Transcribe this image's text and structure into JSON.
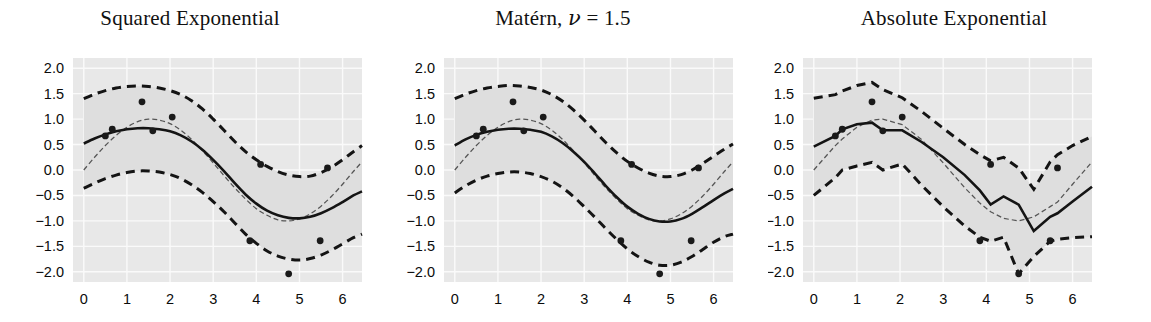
{
  "figure": {
    "background": "#ffffff",
    "panel_background": "#e8e8e8",
    "grid_color": "#fafafa",
    "line_color": "#141414",
    "point_color": "#1a1a1a",
    "truth_color": "#555555",
    "width": 1151,
    "height": 322
  },
  "axis": {
    "ytick_labels": [
      "2.0",
      "1.5",
      "1.0",
      "0.5",
      "0.0",
      "−0.5",
      "−1.0",
      "−1.5",
      "−2.0"
    ],
    "ytick_values": [
      2.0,
      1.5,
      1.0,
      0.5,
      0.0,
      -0.5,
      -1.0,
      -1.5,
      -2.0
    ],
    "xtick_labels": [
      "0",
      "1",
      "2",
      "3",
      "4",
      "5",
      "6"
    ],
    "xtick_values": [
      0,
      1,
      2,
      3,
      4,
      5,
      6
    ],
    "xlim": [
      -0.25,
      6.45
    ],
    "ylim": [
      -2.2,
      2.2
    ]
  },
  "observations": {
    "x": [
      0.5,
      0.66,
      1.35,
      1.6,
      2.05,
      3.85,
      4.1,
      4.75,
      5.48,
      5.65
    ],
    "y": [
      0.67,
      0.8,
      1.34,
      0.77,
      1.04,
      -1.39,
      0.11,
      -2.04,
      -1.39,
      0.04
    ]
  },
  "chart_data": [
    {
      "type": "line",
      "panel_index": 0,
      "title": "Squared Exponential",
      "title_plain": "Squared Exponential",
      "xlabel": "",
      "ylabel": "",
      "xlim": [
        -0.25,
        6.45
      ],
      "ylim": [
        -2.2,
        2.2
      ],
      "grid": true,
      "legend": "none",
      "x": [
        0.0,
        0.25,
        0.5,
        0.75,
        1.0,
        1.25,
        1.5,
        1.75,
        2.0,
        2.25,
        2.5,
        2.75,
        3.0,
        3.25,
        3.5,
        3.75,
        4.0,
        4.25,
        4.5,
        4.75,
        5.0,
        5.25,
        5.5,
        5.75,
        6.0,
        6.25,
        6.45
      ],
      "series": [
        {
          "name": "posterior mean",
          "style": "solid",
          "values": [
            0.52,
            0.62,
            0.7,
            0.76,
            0.8,
            0.82,
            0.82,
            0.8,
            0.76,
            0.68,
            0.56,
            0.4,
            0.2,
            -0.02,
            -0.26,
            -0.48,
            -0.66,
            -0.8,
            -0.89,
            -0.94,
            -0.95,
            -0.92,
            -0.85,
            -0.75,
            -0.63,
            -0.5,
            -0.42
          ]
        },
        {
          "name": "upper 95% band",
          "style": "dashed",
          "values": [
            1.4,
            1.49,
            1.56,
            1.61,
            1.64,
            1.65,
            1.64,
            1.61,
            1.56,
            1.48,
            1.36,
            1.2,
            1.0,
            0.78,
            0.56,
            0.36,
            0.2,
            0.07,
            -0.03,
            -0.1,
            -0.13,
            -0.12,
            -0.05,
            0.06,
            0.2,
            0.36,
            0.48
          ]
        },
        {
          "name": "lower 95% band",
          "style": "dashed",
          "values": [
            -0.36,
            -0.26,
            -0.17,
            -0.1,
            -0.05,
            -0.02,
            -0.02,
            -0.04,
            -0.09,
            -0.17,
            -0.29,
            -0.44,
            -0.62,
            -0.82,
            -1.04,
            -1.26,
            -1.44,
            -1.59,
            -1.69,
            -1.75,
            -1.77,
            -1.74,
            -1.67,
            -1.57,
            -1.45,
            -1.33,
            -1.26
          ]
        },
        {
          "name": "true function",
          "style": "thin-dashed",
          "values": [
            0.0,
            0.25,
            0.48,
            0.68,
            0.84,
            0.95,
            1.0,
            0.98,
            0.91,
            0.78,
            0.6,
            0.38,
            0.14,
            -0.11,
            -0.35,
            -0.57,
            -0.76,
            -0.89,
            -0.98,
            -1.0,
            -0.96,
            -0.86,
            -0.71,
            -0.51,
            -0.28,
            -0.03,
            0.16
          ]
        }
      ]
    },
    {
      "type": "line",
      "panel_index": 1,
      "title": "Matérn, ν = 1.5",
      "title_prefix": "Matérn, ",
      "title_var": "ν",
      "title_suffix": " = 1.5",
      "xlabel": "",
      "ylabel": "",
      "xlim": [
        -0.25,
        6.45
      ],
      "ylim": [
        -2.2,
        2.2
      ],
      "grid": true,
      "legend": "none",
      "x": [
        0.0,
        0.25,
        0.5,
        0.75,
        1.0,
        1.25,
        1.5,
        1.75,
        2.0,
        2.25,
        2.5,
        2.75,
        3.0,
        3.25,
        3.5,
        3.75,
        4.0,
        4.25,
        4.5,
        4.75,
        5.0,
        5.25,
        5.5,
        5.75,
        6.0,
        6.25,
        6.45
      ],
      "series": [
        {
          "name": "posterior mean",
          "style": "solid",
          "values": [
            0.48,
            0.6,
            0.69,
            0.75,
            0.79,
            0.81,
            0.81,
            0.79,
            0.75,
            0.66,
            0.53,
            0.36,
            0.16,
            -0.07,
            -0.31,
            -0.53,
            -0.72,
            -0.86,
            -0.96,
            -1.01,
            -1.01,
            -0.96,
            -0.86,
            -0.73,
            -0.59,
            -0.46,
            -0.37
          ]
        },
        {
          "name": "upper 95% band",
          "style": "dashed",
          "values": [
            1.4,
            1.49,
            1.56,
            1.61,
            1.64,
            1.66,
            1.65,
            1.62,
            1.57,
            1.48,
            1.35,
            1.18,
            0.98,
            0.76,
            0.54,
            0.34,
            0.17,
            0.04,
            -0.06,
            -0.12,
            -0.13,
            -0.09,
            0.0,
            0.13,
            0.27,
            0.41,
            0.51
          ]
        },
        {
          "name": "lower 95% band",
          "style": "dashed",
          "values": [
            -0.45,
            -0.31,
            -0.2,
            -0.12,
            -0.07,
            -0.04,
            -0.04,
            -0.07,
            -0.13,
            -0.22,
            -0.35,
            -0.52,
            -0.72,
            -0.93,
            -1.15,
            -1.36,
            -1.55,
            -1.7,
            -1.81,
            -1.87,
            -1.87,
            -1.81,
            -1.7,
            -1.56,
            -1.42,
            -1.31,
            -1.26
          ]
        },
        {
          "name": "true function",
          "style": "thin-dashed",
          "values": [
            0.0,
            0.25,
            0.48,
            0.68,
            0.84,
            0.95,
            1.0,
            0.98,
            0.91,
            0.78,
            0.6,
            0.38,
            0.14,
            -0.11,
            -0.35,
            -0.57,
            -0.76,
            -0.89,
            -0.98,
            -1.0,
            -0.96,
            -0.86,
            -0.71,
            -0.51,
            -0.28,
            -0.03,
            0.16
          ]
        }
      ]
    },
    {
      "type": "line",
      "panel_index": 2,
      "title": "Absolute Exponential",
      "title_plain": "Absolute Exponential",
      "xlabel": "",
      "ylabel": "",
      "xlim": [
        -0.25,
        6.45
      ],
      "ylim": [
        -2.2,
        2.2
      ],
      "grid": true,
      "legend": "none",
      "x": [
        0.0,
        0.5,
        0.66,
        1.0,
        1.35,
        1.6,
        2.05,
        2.5,
        3.0,
        3.5,
        3.85,
        4.1,
        4.4,
        4.75,
        5.1,
        5.48,
        5.65,
        6.0,
        6.45
      ],
      "series": [
        {
          "name": "posterior mean",
          "style": "solid",
          "values": [
            0.46,
            0.67,
            0.8,
            0.9,
            0.93,
            0.78,
            0.78,
            0.55,
            0.25,
            -0.1,
            -0.4,
            -0.68,
            -0.52,
            -0.68,
            -1.2,
            -0.92,
            -0.85,
            -0.62,
            -0.33
          ]
        },
        {
          "name": "upper 95% band",
          "style": "dashed",
          "values": [
            1.41,
            1.48,
            1.55,
            1.66,
            1.72,
            1.58,
            1.42,
            1.15,
            0.82,
            0.5,
            0.3,
            0.18,
            0.25,
            0.04,
            -0.38,
            0.16,
            0.3,
            0.48,
            0.66
          ]
        },
        {
          "name": "lower 95% band",
          "style": "dashed",
          "values": [
            -0.5,
            -0.15,
            0.0,
            0.08,
            0.15,
            0.0,
            0.12,
            -0.3,
            -0.72,
            -1.1,
            -1.32,
            -1.4,
            -1.32,
            -2.04,
            -1.7,
            -1.4,
            -1.36,
            -1.33,
            -1.31
          ]
        },
        {
          "name": "true function",
          "style": "thin-dashed",
          "values": [
            0.0,
            0.48,
            0.61,
            0.84,
            0.98,
            1.0,
            0.89,
            0.6,
            0.14,
            -0.35,
            -0.65,
            -0.82,
            -0.95,
            -1.0,
            -0.92,
            -0.72,
            -0.63,
            -0.28,
            0.16
          ]
        }
      ]
    }
  ]
}
